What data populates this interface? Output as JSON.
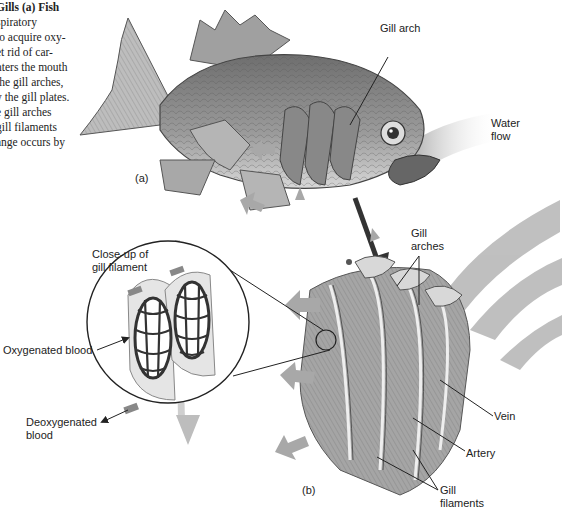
{
  "caption": {
    "lines": [
      "Gills (a) Fish",
      "spiratory",
      "to acquire oxy-",
      "et rid of car-",
      "nters the mouth",
      " the gill arches,",
      "y the gill plates.",
      "e gill arches",
      "gill filaments",
      "ange occurs by"
    ]
  },
  "labels": {
    "gill_arch": "Gill arch",
    "water_flow_1": "Water",
    "water_flow_2": "flow",
    "panel_a": "(a)",
    "closeup_1": "Close-up of",
    "closeup_2": "gill filament",
    "oxygenated": "Oxygenated blood",
    "deoxygenated_1": "Deoxygenated",
    "deoxygenated_2": "blood",
    "gill_arches_1": "Gill",
    "gill_arches_2": "arches",
    "vein": "Vein",
    "artery": "Artery",
    "gill_filaments_1": "Gill",
    "gill_filaments_2": "filaments",
    "panel_b": "(b)"
  },
  "colors": {
    "arrow_gray": "#a8a8a8",
    "fish_body": "#8a8a8a",
    "line": "#222222"
  }
}
